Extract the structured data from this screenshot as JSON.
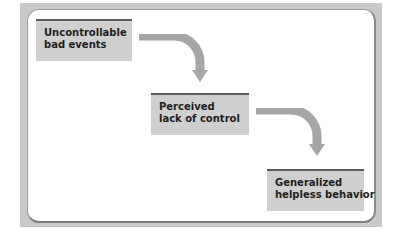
{
  "diagram": {
    "type": "flowchart",
    "steps": [
      {
        "line1": "Uncontrollable",
        "line2": "bad events"
      },
      {
        "line1": "Perceived",
        "line2": "lack of control"
      },
      {
        "line1": "Generalized",
        "line2": "helpless behavior"
      }
    ],
    "connectors": [
      {
        "from": 0,
        "to": 1,
        "shape": "curved-arrow-down"
      },
      {
        "from": 1,
        "to": 2,
        "shape": "curved-arrow-down"
      }
    ],
    "colors": {
      "frame": "#c9c9c9",
      "panel": "#ffffff",
      "box_fill": "#cfcfcf",
      "box_top_bar": "#5c5c5c",
      "arrow": "#a6a6a6",
      "text": "#1e1e1e"
    }
  }
}
